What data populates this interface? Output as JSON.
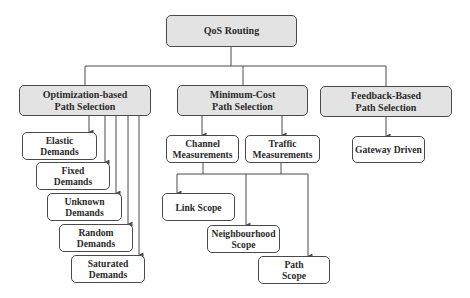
{
  "diagram": {
    "title": "QoS Routing",
    "colors": {
      "category_fill": "#e3e3e3",
      "leaf_fill": "#ffffff",
      "border": "#4a4a4a",
      "line": "#4a4a4a",
      "text": "#2b2b2b"
    },
    "root": {
      "label": "QoS Routing"
    },
    "categories": [
      {
        "label": "Optimization-based\nPath Selection",
        "children": [
          {
            "label": "Elastic\nDemands"
          },
          {
            "label": "Fixed\nDemands"
          },
          {
            "label": "Unknown\nDemands"
          },
          {
            "label": "Random\nDemands"
          },
          {
            "label": "Saturated\nDemands"
          }
        ]
      },
      {
        "label": "Minimum-Cost\nPath Selection",
        "children": [
          {
            "label": "Channel\nMeasurements"
          },
          {
            "label": "Traffic\nMeasurements"
          }
        ],
        "scopes": [
          {
            "label": "Link Scope"
          },
          {
            "label": "Neighbourhood\nScope"
          },
          {
            "label": "Path\nScope"
          }
        ]
      },
      {
        "label": "Feedback-Based\nPath Selection",
        "children": [
          {
            "label": "Gateway Driven"
          }
        ]
      }
    ]
  }
}
